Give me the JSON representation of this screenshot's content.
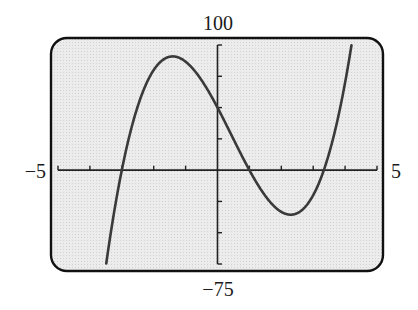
{
  "chart_data": {
    "type": "line",
    "title": "",
    "xlabel": "",
    "ylabel": "",
    "xlim": [
      -5,
      5
    ],
    "ylim": [
      -75,
      100
    ],
    "x_tick_step": 1,
    "y_tick_step": 25,
    "grid": false,
    "legend": null,
    "window_labels": {
      "xmin": "−5",
      "xmax": "5",
      "ymin": "−75",
      "ymax": "100"
    },
    "series": [
      {
        "name": "f(x)",
        "function": "cubic with roots -3, 1, 10/3; f(x) = (5/3)(x+3)(x-1)(3x-10)",
        "roots": [
          -3,
          1,
          3.33
        ],
        "y_intercept": 50,
        "local_max": {
          "x": -1.4,
          "y": 91
        },
        "local_min": {
          "x": 2.3,
          "y": -36
        },
        "x": [
          -3.49,
          -3.0,
          -2.5,
          -2.0,
          -1.5,
          -1.0,
          -0.5,
          0.0,
          0.5,
          1.0,
          1.5,
          2.0,
          2.5,
          3.0,
          3.33,
          3.5,
          4.0,
          4.2
        ],
        "y": [
          -75,
          0,
          46.7,
          70.0,
          89.3,
          86.7,
          71.7,
          50.0,
          27.5,
          0,
          -18.8,
          -33.3,
          -36.7,
          -20.0,
          0,
          11.7,
          53.3,
          100
        ]
      }
    ],
    "colors": {
      "curve": "#3a3a3a",
      "frame": "#111111",
      "axes": "#222222",
      "background": "#e6e6e6"
    }
  }
}
